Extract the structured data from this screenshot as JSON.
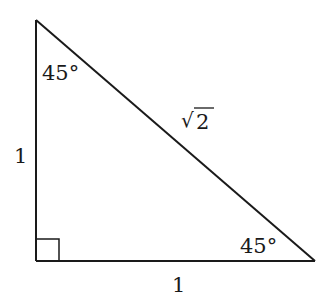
{
  "diagram": {
    "type": "right-triangle",
    "vertices": {
      "top": [
        36,
        20
      ],
      "right_angle": [
        36,
        261
      ],
      "right": [
        315,
        261
      ]
    },
    "angles": {
      "top": "45°",
      "right": "45°",
      "bottom_left": "right angle"
    },
    "sides": {
      "left_leg": "1",
      "bottom_leg": "1",
      "hypotenuse_radical": "√",
      "hypotenuse_value": "2"
    },
    "colors": {
      "stroke": "#1a1a1a",
      "background": "#ffffff"
    }
  }
}
